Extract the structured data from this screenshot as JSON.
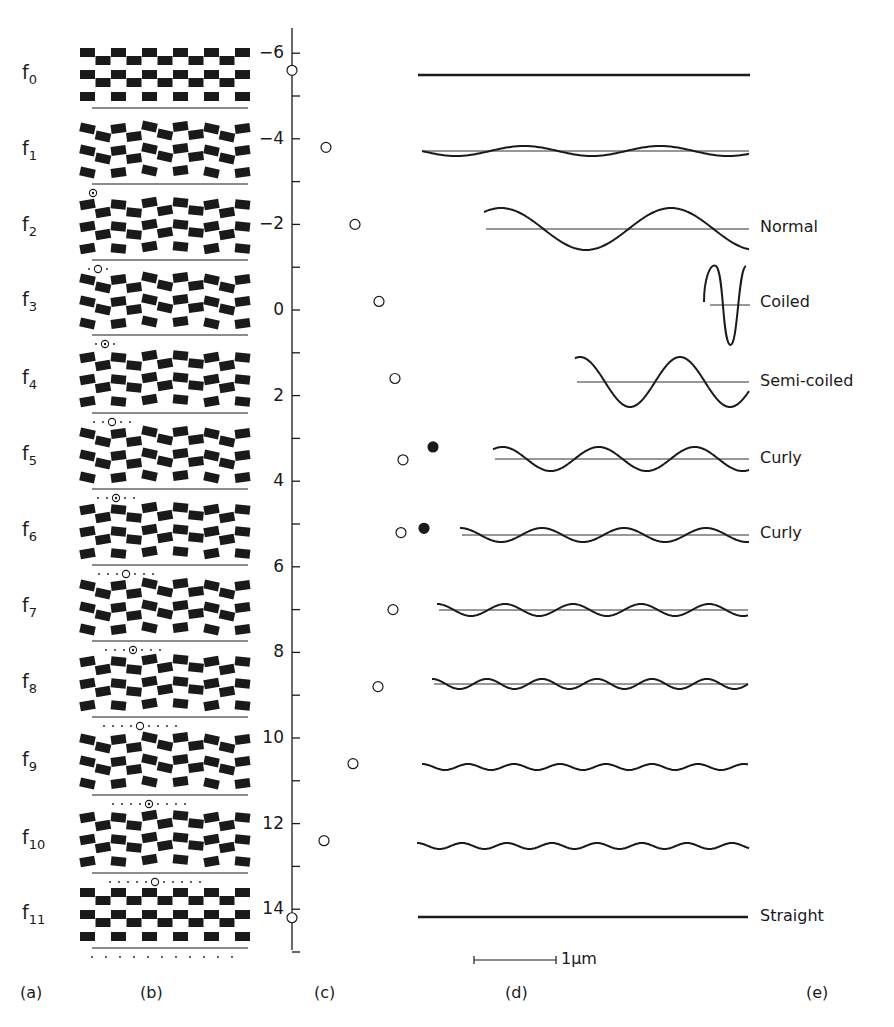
{
  "panels": {
    "a": "(a)",
    "b": "(b)",
    "c": "(c)",
    "d": "(d)",
    "e": "(e)"
  },
  "rows": [
    {
      "label": "f",
      "sub": "0",
      "y": 75,
      "marker_x": null,
      "dots": 0
    },
    {
      "label": "f",
      "sub": "1",
      "y": 151,
      "marker_x": 93,
      "dots": 0
    },
    {
      "label": "f",
      "sub": "2",
      "y": 227,
      "marker_x": 98,
      "dots": 1
    },
    {
      "label": "f",
      "sub": "3",
      "y": 302,
      "marker_x": 105,
      "dots": 1
    },
    {
      "label": "f",
      "sub": "4",
      "y": 380,
      "marker_x": 112,
      "dots": 2
    },
    {
      "label": "f",
      "sub": "5",
      "y": 456,
      "marker_x": 116,
      "dots": 2
    },
    {
      "label": "f",
      "sub": "6",
      "y": 532,
      "marker_x": 126,
      "dots": 3
    },
    {
      "label": "f",
      "sub": "7",
      "y": 608,
      "marker_x": 133,
      "dots": 3
    },
    {
      "label": "f",
      "sub": "8",
      "y": 684,
      "marker_x": 140,
      "dots": 4
    },
    {
      "label": "f",
      "sub": "9",
      "y": 762,
      "marker_x": 149,
      "dots": 4
    },
    {
      "label": "f",
      "sub": "10",
      "y": 840,
      "marker_x": 155,
      "dots": 5
    },
    {
      "label": "f",
      "sub": "11",
      "y": 915,
      "marker_x": null,
      "dots": 11
    }
  ],
  "chart_data": {
    "type": "scatter",
    "title": "",
    "xlabel": "",
    "ylabel": "",
    "axis": {
      "ticks": [
        -6,
        -4,
        -2,
        0,
        2,
        4,
        6,
        8,
        10,
        12,
        14
      ],
      "ylim": [
        -6.7,
        15
      ],
      "minor_step": 1
    },
    "series": [
      {
        "name": "open",
        "marker": "open-circle",
        "points": [
          {
            "row": "f0",
            "value": -5.6,
            "offset": 0
          },
          {
            "row": "f1",
            "value": -3.8,
            "offset": 34
          },
          {
            "row": "f2",
            "value": -2.0,
            "offset": 63
          },
          {
            "row": "f3",
            "value": -0.2,
            "offset": 87
          },
          {
            "row": "f4",
            "value": 1.6,
            "offset": 103
          },
          {
            "row": "f5",
            "value": 3.5,
            "offset": 111
          },
          {
            "row": "f6",
            "value": 5.2,
            "offset": 109
          },
          {
            "row": "f7",
            "value": 7.0,
            "offset": 101
          },
          {
            "row": "f8",
            "value": 8.8,
            "offset": 86
          },
          {
            "row": "f9",
            "value": 10.6,
            "offset": 61
          },
          {
            "row": "f10",
            "value": 12.4,
            "offset": 32
          },
          {
            "row": "f11",
            "value": 14.2,
            "offset": 0
          }
        ]
      },
      {
        "name": "filled",
        "marker": "filled-circle",
        "points": [
          {
            "row": "f5",
            "value": 3.2,
            "offset": 141
          },
          {
            "row": "f6",
            "value": 5.1,
            "offset": 132
          }
        ]
      }
    ]
  },
  "shapes": [
    {
      "row": "f0",
      "x0": 418,
      "x1": 750,
      "y": 75,
      "amp": 0,
      "wavelength": 0,
      "phase": 0,
      "baseline": false,
      "label": ""
    },
    {
      "row": "f1",
      "x0": 422,
      "x1": 749,
      "y": 151,
      "amp": 5,
      "wavelength": 136,
      "phase": 0.5,
      "baseline": true,
      "label": ""
    },
    {
      "row": "f2",
      "x0": 484,
      "x1": 749,
      "y": 229,
      "amp": 21,
      "wavelength": 170,
      "phase": 0.15,
      "baseline": true,
      "label": "Normal"
    },
    {
      "row": "f4",
      "x0": 575,
      "x1": 749,
      "y": 382,
      "amp": 25,
      "wavelength": 100,
      "phase": 0.2,
      "baseline": true,
      "label": "Semi-coiled"
    },
    {
      "row": "f5",
      "x0": 493,
      "x1": 749,
      "y": 459,
      "amp": 12,
      "wavelength": 96,
      "phase": 0.15,
      "baseline": true,
      "label": "Curly"
    },
    {
      "row": "f6",
      "x0": 460,
      "x1": 749,
      "y": 535,
      "amp": 7,
      "wavelength": 82,
      "phase": 0.25,
      "baseline": true,
      "label": "Curly"
    },
    {
      "row": "f7",
      "x0": 437,
      "x1": 748,
      "y": 610,
      "amp": 6,
      "wavelength": 68,
      "phase": 0.25,
      "baseline": true,
      "label": ""
    },
    {
      "row": "f8",
      "x0": 432,
      "x1": 748,
      "y": 684,
      "amp": 5,
      "wavelength": 55,
      "phase": 0.25,
      "baseline": true,
      "label": ""
    },
    {
      "row": "f9",
      "x0": 422,
      "x1": 748,
      "y": 767,
      "amp": 3,
      "wavelength": 46,
      "phase": 0.25,
      "baseline": false,
      "label": ""
    },
    {
      "row": "f10",
      "x0": 417,
      "x1": 749,
      "y": 846,
      "amp": 3,
      "wavelength": 45,
      "phase": 0.25,
      "baseline": false,
      "label": ""
    },
    {
      "row": "f11",
      "x0": 418,
      "x1": 748,
      "y": 917,
      "amp": 0,
      "wavelength": 0,
      "phase": 0,
      "baseline": false,
      "label": "Straight"
    }
  ],
  "coiled": {
    "row": "f3",
    "label": "Coiled",
    "y": 304
  },
  "shape_labels": [
    {
      "text": "Normal",
      "y": 228
    },
    {
      "text": "Coiled",
      "y": 303
    },
    {
      "text": "Semi-coiled",
      "y": 382
    },
    {
      "text": "Curly",
      "y": 459
    },
    {
      "text": "Curly",
      "y": 534
    },
    {
      "text": "Straight",
      "y": 917
    }
  ],
  "scale_bar": {
    "label": "1µm",
    "x0": 474,
    "x1": 556,
    "y": 960
  },
  "colors": {
    "ink": "#1a1a1a",
    "background": "#ffffff"
  }
}
